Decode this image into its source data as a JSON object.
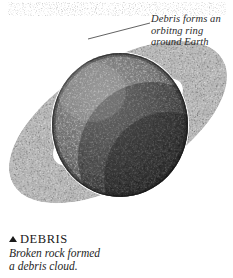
{
  "figure": {
    "name": "earth-debris-ring-illustration",
    "subject": "Earth",
    "annotation": {
      "icon": "leader-line",
      "lines": [
        "Debris forms an",
        "orbitng ring",
        "around Earth"
      ]
    },
    "caption": {
      "bullet_icon": "up-triangle-bullet",
      "heading": "DEBRIS",
      "lines": [
        "Broken rock formed",
        "a debris cloud."
      ]
    },
    "colors": {
      "background": "#ffffff",
      "text": "#2b2b2b",
      "heading": "#1a1a1a",
      "leader_line": "#3a3a3a",
      "planet_dark": "#3a3a3a",
      "planet_mid": "#6b6b6b",
      "planet_light": "#9a9a9a",
      "planet_shadow": "#1c1c1c",
      "debris_speck": "#2a2a2a",
      "debris_highlight": "#e8e8e8"
    }
  }
}
